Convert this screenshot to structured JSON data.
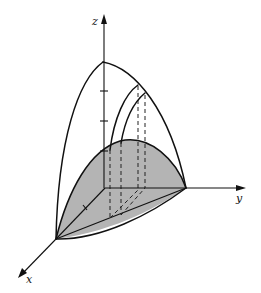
{
  "figure": {
    "type": "3d-solid-diagram",
    "axes": {
      "x": {
        "label": "x"
      },
      "y": {
        "label": "y"
      },
      "z": {
        "label": "z"
      }
    },
    "colors": {
      "line": "#111111",
      "shaded_region": "#b4b4b4",
      "background": "#ffffff"
    },
    "elements": {
      "outer_surface": "parabolic dome bounding the solid",
      "base_region": "shaded region in the xy-plane bounded by a parabolic arc and the y-axis/x-axis edges",
      "cross_sections": 2,
      "z_axis_ticks": 3,
      "dashed_projection_lines": 4
    }
  }
}
